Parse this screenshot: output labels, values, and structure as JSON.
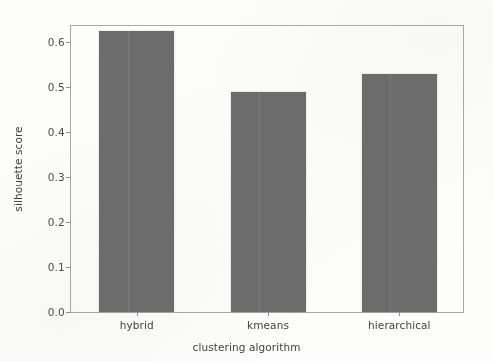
{
  "chart_data": {
    "type": "bar",
    "title": "",
    "xlabel": "clustering algorithm",
    "ylabel": "silhouette score",
    "categories": [
      "hybrid",
      "kmeans",
      "hierarchical"
    ],
    "values": [
      0.625,
      0.49,
      0.53
    ],
    "ylim": [
      0.0,
      0.64
    ],
    "yticks": [
      "0.0",
      "0.1",
      "0.2",
      "0.3",
      "0.4",
      "0.5",
      "0.6"
    ],
    "ytick_values": [
      0.0,
      0.1,
      0.2,
      0.3,
      0.4,
      0.5,
      0.6
    ],
    "grid": false,
    "legend": null,
    "bar_color": "#6b6b6b",
    "frame_color": "#a9a9a9",
    "background_color": "#fdfdfc",
    "text_color": "#3f3f3f"
  }
}
